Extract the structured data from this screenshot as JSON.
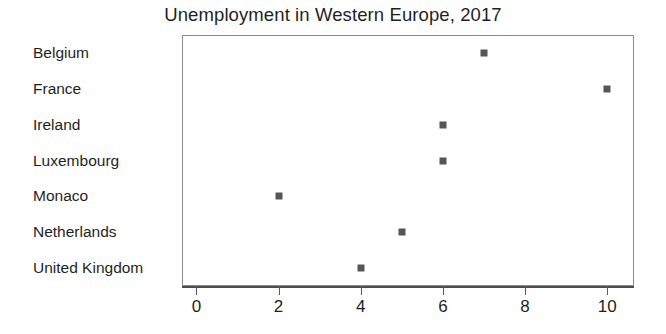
{
  "chart_data": {
    "type": "scatter",
    "title": "Unemployment in Western Europe, 2017",
    "xlabel": "",
    "ylabel": "",
    "categories": [
      "Belgium",
      "France",
      "Ireland",
      "Luxembourg",
      "Monaco",
      "Netherlands",
      "United Kingdom"
    ],
    "values": [
      7,
      10,
      6,
      6,
      2,
      5,
      4
    ],
    "points": [
      {
        "category": "Belgium",
        "value": 7
      },
      {
        "category": "France",
        "value": 10
      },
      {
        "category": "Ireland",
        "value": 6
      },
      {
        "category": "Luxembourg",
        "value": 6
      },
      {
        "category": "Monaco",
        "value": 2
      },
      {
        "category": "Netherlands",
        "value": 5
      },
      {
        "category": "United Kingdom",
        "value": 4
      }
    ],
    "xticks": [
      0,
      2,
      4,
      6,
      8,
      10
    ],
    "xtick_labels": [
      "0",
      "2",
      "4",
      "6",
      "8",
      "10"
    ],
    "xlim": [
      -0.35,
      10.65
    ],
    "grid": false,
    "legend": null,
    "marker": "square",
    "marker_color": "#565656",
    "frame_color": "#8c8c8c",
    "axis_color": "#4d4d4d",
    "background_color": "#ffffff",
    "text_color": "#1f1f1f"
  }
}
